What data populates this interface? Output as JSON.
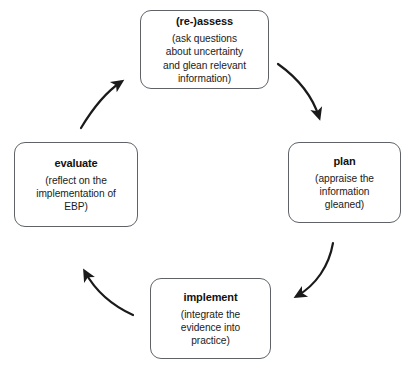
{
  "diagram": {
    "type": "cycle",
    "direction": "clockwise",
    "nodes": [
      {
        "id": "assess",
        "title": "(re-)assess",
        "body": "(ask questions\nabout uncertainty\nand glean relevant\ninformation)"
      },
      {
        "id": "plan",
        "title": "plan",
        "body": "(appraise the\ninformation\ngleaned)"
      },
      {
        "id": "implement",
        "title": "implement",
        "body": "(integrate the\nevidence into\npractice)"
      },
      {
        "id": "evaluate",
        "title": "evaluate",
        "body": "(reflect on the\nimplementation of\nEBP)"
      }
    ],
    "arrows": [
      {
        "id": "assess-to-plan",
        "from": "assess",
        "to": "plan",
        "name": "arrow-assess-to-plan"
      },
      {
        "id": "plan-to-implement",
        "from": "plan",
        "to": "implement",
        "name": "arrow-plan-to-implement"
      },
      {
        "id": "implement-to-evaluate",
        "from": "implement",
        "to": "evaluate",
        "name": "arrow-implement-to-evaluate"
      },
      {
        "id": "evaluate-to-assess",
        "from": "evaluate",
        "to": "assess",
        "name": "arrow-evaluate-to-assess"
      }
    ],
    "colors": {
      "background": "#ffffff",
      "box_border": "#5f6368",
      "arrow": "#1a1a1a",
      "title_text": "#111111",
      "body_text": "#1b1b1b"
    }
  }
}
